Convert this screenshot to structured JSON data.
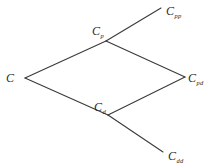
{
  "figure": {
    "type": "recombining-binomial-tree",
    "background_color": "#ffffff",
    "line_color": "#3a3a3a",
    "line_width": 1.1,
    "width": 211,
    "height": 168
  },
  "nodes": [
    {
      "id": "c",
      "base": "C",
      "sub": "",
      "x": 25,
      "y": 78,
      "label_x": 6,
      "label_y": 69
    },
    {
      "id": "cp",
      "base": "C",
      "sub": "p",
      "x": 106,
      "y": 41,
      "label_x": 92,
      "label_y": 22
    },
    {
      "id": "cd",
      "base": "C",
      "sub": "d",
      "x": 108,
      "y": 115,
      "label_x": 94,
      "label_y": 98
    },
    {
      "id": "cpp",
      "base": "C",
      "sub": "pp",
      "x": 161,
      "y": 8,
      "label_x": 166,
      "label_y": 2
    },
    {
      "id": "cpd",
      "base": "C",
      "sub": "pd",
      "x": 185,
      "y": 77,
      "label_x": 188,
      "label_y": 69
    },
    {
      "id": "cdd",
      "base": "C",
      "sub": "dd",
      "x": 163,
      "y": 152,
      "label_x": 168,
      "label_y": 147
    }
  ],
  "edges": [
    {
      "id": "edge-c-cp",
      "from": "c",
      "to": "cp",
      "x1": 25,
      "y1": 78,
      "x2": 106,
      "y2": 41
    },
    {
      "id": "edge-c-cd",
      "from": "c",
      "to": "cd",
      "x1": 25,
      "y1": 78,
      "x2": 108,
      "y2": 115
    },
    {
      "id": "edge-cp-cpp",
      "from": "cp",
      "to": "cpp",
      "x1": 106,
      "y1": 41,
      "x2": 161,
      "y2": 8
    },
    {
      "id": "edge-cp-cpd",
      "from": "cp",
      "to": "cpd",
      "x1": 106,
      "y1": 41,
      "x2": 185,
      "y2": 77
    },
    {
      "id": "edge-cd-cpd",
      "from": "cd",
      "to": "cpd",
      "x1": 108,
      "y1": 115,
      "x2": 185,
      "y2": 77
    },
    {
      "id": "edge-cd-cdd",
      "from": "cd",
      "to": "cdd",
      "x1": 108,
      "y1": 115,
      "x2": 163,
      "y2": 152
    }
  ]
}
